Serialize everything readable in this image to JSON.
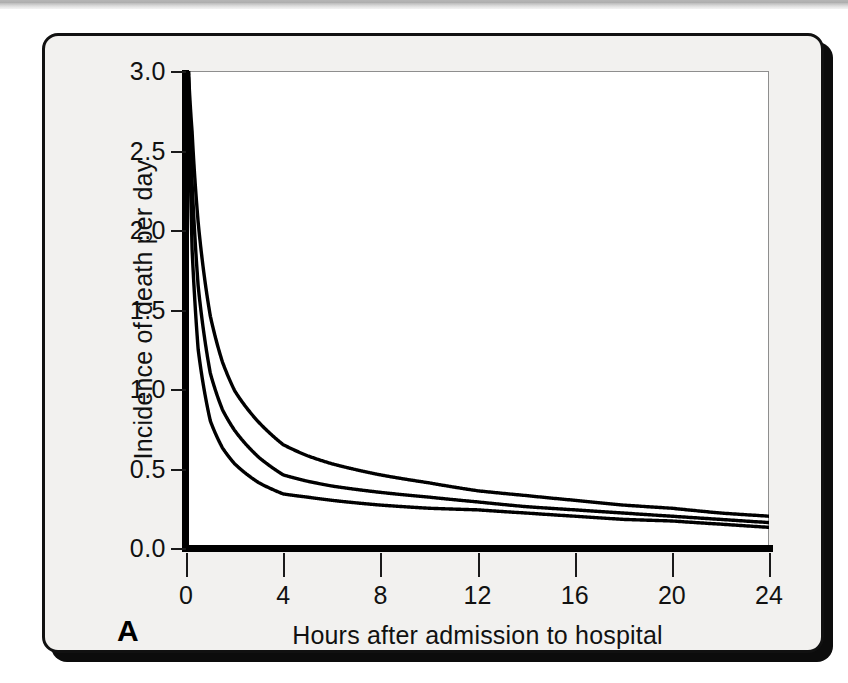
{
  "figure": {
    "panel_label": "A",
    "background_color": "#f2f1ef",
    "border_color": "#111111",
    "curve_color": "#000000"
  },
  "chart_data": {
    "type": "line",
    "title": "",
    "xlabel": "Hours after admission to hospital",
    "ylabel": "Incidence of death per day",
    "xlim": [
      0,
      24
    ],
    "ylim": [
      0.0,
      3.0
    ],
    "xticks": [
      0,
      4,
      8,
      12,
      16,
      20,
      24
    ],
    "xtick_labels": [
      "0",
      "4",
      "8",
      "12",
      "16",
      "20",
      "24"
    ],
    "yticks": [
      0.0,
      0.5,
      1.0,
      1.5,
      2.0,
      2.5,
      3.0
    ],
    "ytick_labels": [
      "0.0",
      "0.5",
      "1.0",
      "1.5",
      "2.0",
      "2.5",
      "3.0"
    ],
    "grid": false,
    "legend": "none",
    "x": [
      0.1,
      0.25,
      0.5,
      1,
      1.5,
      2,
      3,
      4,
      5,
      6,
      8,
      10,
      12,
      14,
      16,
      18,
      20,
      22,
      24
    ],
    "series": [
      {
        "name": "upper curve",
        "values": [
          3.0,
          2.62,
          2.05,
          1.46,
          1.17,
          0.99,
          0.79,
          0.65,
          0.58,
          0.53,
          0.46,
          0.41,
          0.36,
          0.33,
          0.3,
          0.27,
          0.25,
          0.22,
          0.2
        ]
      },
      {
        "name": "middle curve",
        "values": [
          3.0,
          2.3,
          1.65,
          1.1,
          0.87,
          0.74,
          0.57,
          0.46,
          0.42,
          0.39,
          0.35,
          0.32,
          0.29,
          0.26,
          0.24,
          0.22,
          0.2,
          0.18,
          0.16
        ]
      },
      {
        "name": "lower curve",
        "values": [
          3.0,
          1.88,
          1.25,
          0.8,
          0.63,
          0.53,
          0.41,
          0.34,
          0.32,
          0.3,
          0.27,
          0.25,
          0.24,
          0.22,
          0.2,
          0.18,
          0.17,
          0.15,
          0.13
        ]
      }
    ]
  }
}
